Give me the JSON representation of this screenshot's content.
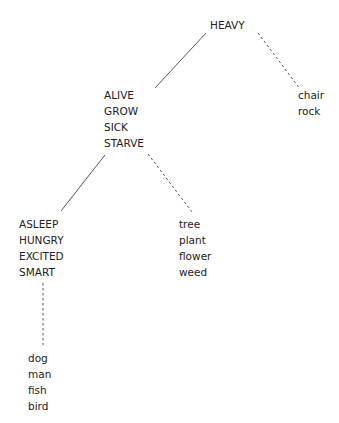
{
  "diagram": {
    "type": "predicability-tree",
    "nodes": [
      {
        "id": "root",
        "terms": [
          "HEAVY"
        ],
        "x": 210,
        "y": 17
      },
      {
        "id": "living",
        "terms": [
          "ALIVE",
          "GROW",
          "SICK",
          "STARVE"
        ],
        "x": 104,
        "y": 87
      },
      {
        "id": "objects",
        "terms": [
          "chair",
          "rock"
        ],
        "x": 298,
        "y": 87
      },
      {
        "id": "animate",
        "terms": [
          "ASLEEP",
          "HUNGRY",
          "EXCITED",
          "SMART"
        ],
        "x": 19,
        "y": 216
      },
      {
        "id": "plants",
        "terms": [
          "tree",
          "plant",
          "flower",
          "weed"
        ],
        "x": 179,
        "y": 216
      },
      {
        "id": "animals",
        "terms": [
          "dog",
          "man",
          "fish",
          "bird"
        ],
        "x": 28,
        "y": 350
      }
    ],
    "edges": [
      {
        "from": "root",
        "to": "living",
        "style": "solid",
        "x1": 206,
        "y1": 33,
        "x2": 155,
        "y2": 88
      },
      {
        "from": "root",
        "to": "objects",
        "style": "dashed",
        "x1": 258,
        "y1": 33,
        "x2": 300,
        "y2": 89
      },
      {
        "from": "living",
        "to": "animate",
        "style": "solid",
        "x1": 105,
        "y1": 155,
        "x2": 61,
        "y2": 211
      },
      {
        "from": "living",
        "to": "plants",
        "style": "dashed",
        "x1": 148,
        "y1": 154,
        "x2": 192,
        "y2": 212
      },
      {
        "from": "animate",
        "to": "animals",
        "style": "dashed",
        "x1": 43,
        "y1": 283,
        "x2": 43,
        "y2": 345
      }
    ],
    "colors": {
      "text": "#222222",
      "line": "#444444"
    }
  }
}
